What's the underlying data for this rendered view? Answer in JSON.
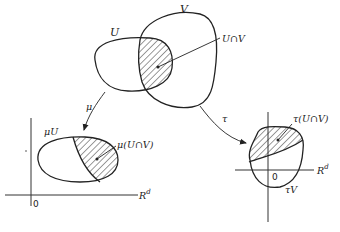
{
  "figure": {
    "top": {
      "set_u_label": "U",
      "set_v_label": "V",
      "intersection_label": "U∩V"
    },
    "maps": {
      "mu_label": "μ",
      "tau_label": "τ"
    },
    "left_chart": {
      "image_label": "μU",
      "intersection_label": "μ(U∩V)",
      "origin_label": "0",
      "space_label": "R",
      "space_exponent": "d"
    },
    "right_chart": {
      "image_label": "τV",
      "intersection_label": "τ(U∩V)",
      "origin_label": "0",
      "space_label": "R",
      "space_exponent": "d"
    },
    "colors": {
      "stroke": "#222222",
      "background": "#ffffff"
    }
  }
}
